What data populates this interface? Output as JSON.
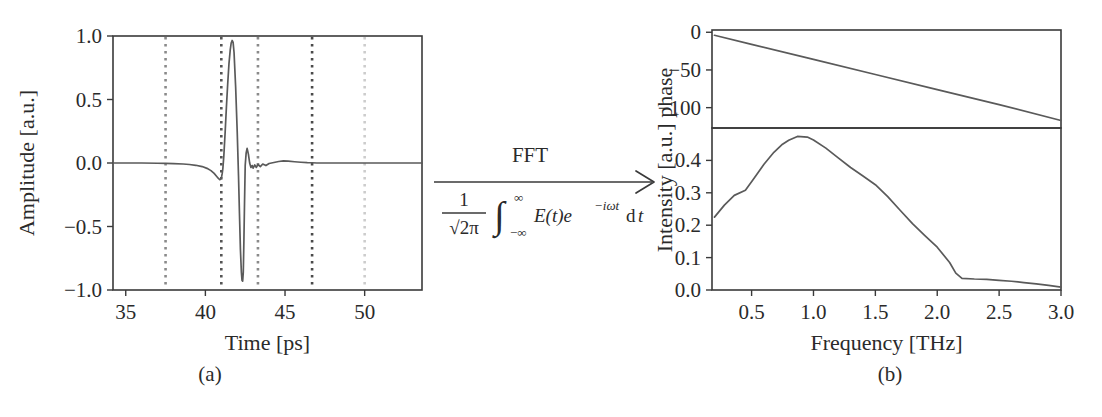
{
  "figure": {
    "sub_labels": {
      "a": "(a)",
      "b": "(b)"
    }
  },
  "transform": {
    "label": "FFT",
    "formula_prefix_num": "1",
    "formula_prefix_den": "√2π",
    "integral": "∫",
    "integral_upper": "∞",
    "integral_lower": "−∞",
    "integrand": "E(t)e",
    "integrand_exp": "−iωt",
    "differential_d": "d",
    "differential_t": "t",
    "arrow": "arrow-right"
  },
  "chart_data": [
    {
      "type": "line",
      "panel": "a",
      "title": "",
      "xlabel": "Time [ps]",
      "ylabel": "Amplitude [a.u.]",
      "xlim": [
        34.2,
        53.6
      ],
      "ylim": [
        -1.0,
        1.0
      ],
      "xticks": [
        35,
        40,
        45,
        50
      ],
      "xtick_labels": [
        "35",
        "40",
        "45",
        "50"
      ],
      "yticks": [
        -1.0,
        -0.5,
        0.0,
        0.5,
        1.0
      ],
      "ytick_labels": [
        "−1.0",
        "−0.5",
        "0.0",
        "0.5",
        "1.0"
      ],
      "grid": false,
      "legend": "none",
      "line_color": "#5a5a5a",
      "markers": [
        {
          "x": 37.5,
          "color": "#8a8a8a",
          "label": "marker-37.5ps"
        },
        {
          "x": 41.0,
          "color": "#555555",
          "label": "marker-41.0ps"
        },
        {
          "x": 43.3,
          "color": "#8a8a8a",
          "label": "marker-43.3ps"
        },
        {
          "x": 46.7,
          "color": "#4a4a4a",
          "label": "marker-46.7ps"
        },
        {
          "x": 50.0,
          "color": "#cccccc",
          "label": "marker-50.0ps"
        }
      ],
      "x": [
        34.2,
        35.0,
        36.0,
        37.0,
        37.5,
        38.0,
        38.6,
        39.0,
        39.4,
        39.8,
        40.1,
        40.35,
        40.55,
        40.7,
        40.82,
        40.9,
        40.96,
        41.02,
        41.06,
        41.1,
        41.16,
        41.24,
        41.32,
        41.4,
        41.48,
        41.56,
        41.62,
        41.68,
        41.74,
        41.8,
        41.9,
        42.0,
        42.08,
        42.14,
        42.2,
        42.26,
        42.3,
        42.34,
        42.38,
        42.42,
        42.46,
        42.5,
        42.56,
        42.62,
        42.7,
        42.78,
        42.86,
        42.94,
        43.0,
        43.1,
        43.2,
        43.3,
        43.45,
        43.6,
        43.8,
        44.0,
        44.3,
        44.6,
        44.9,
        45.2,
        45.6,
        46.0,
        46.4,
        46.7,
        47.0,
        47.5,
        48.0,
        49.0,
        50.0,
        51.0,
        52.0,
        53.0,
        53.6
      ],
      "y": [
        0.0,
        0.0,
        0.0,
        -0.002,
        -0.003,
        -0.005,
        -0.008,
        -0.012,
        -0.018,
        -0.028,
        -0.042,
        -0.06,
        -0.082,
        -0.104,
        -0.122,
        -0.131,
        -0.128,
        -0.108,
        -0.08,
        -0.04,
        0.06,
        0.24,
        0.44,
        0.62,
        0.78,
        0.89,
        0.945,
        0.965,
        0.95,
        0.87,
        0.6,
        0.24,
        -0.1,
        -0.4,
        -0.68,
        -0.86,
        -0.925,
        -0.93,
        -0.86,
        -0.6,
        -0.3,
        -0.02,
        0.08,
        0.115,
        0.07,
        0.0,
        -0.035,
        -0.02,
        -0.04,
        -0.015,
        -0.035,
        -0.012,
        -0.028,
        -0.008,
        -0.02,
        -0.004,
        0.004,
        0.012,
        0.016,
        0.014,
        0.01,
        0.006,
        0.003,
        0.002,
        0.0,
        0.0,
        0.0,
        0.0,
        0.0,
        0.0,
        0.0,
        0.0,
        0.0
      ]
    },
    {
      "type": "line",
      "panel": "b-top",
      "title": "",
      "xlabel": "Frequency [THz]",
      "ylabel": "phase",
      "xlim": [
        0.18,
        3.0
      ],
      "ylim": [
        -127,
        3
      ],
      "yticks": [
        0,
        -50,
        -100
      ],
      "ytick_labels": [
        "0",
        "−50",
        "−100"
      ],
      "grid": false,
      "legend": "none",
      "line_color": "#5a5a5a",
      "x": [
        0.2,
        0.5,
        1.0,
        1.5,
        2.0,
        2.5,
        3.0
      ],
      "y": [
        -4,
        -16,
        -36,
        -56,
        -76,
        -96,
        -117
      ]
    },
    {
      "type": "line",
      "panel": "b-bottom",
      "title": "",
      "xlabel": "Frequency [THz]",
      "ylabel": "Intensity [a.u.]",
      "xlim": [
        0.18,
        3.0
      ],
      "ylim": [
        0.0,
        0.5
      ],
      "xticks": [
        0.5,
        1.0,
        1.5,
        2.0,
        2.5,
        3.0
      ],
      "xtick_labels": [
        "0.5",
        "1.0",
        "1.5",
        "2.0",
        "2.5",
        "3.0"
      ],
      "yticks": [
        0.0,
        0.1,
        0.2,
        0.3,
        0.4
      ],
      "ytick_labels": [
        "0.0",
        "0.1",
        "0.2",
        "0.3",
        "0.4"
      ],
      "grid": false,
      "legend": "none",
      "line_color": "#5a5a5a",
      "x": [
        0.2,
        0.28,
        0.36,
        0.45,
        0.52,
        0.6,
        0.68,
        0.75,
        0.8,
        0.87,
        0.95,
        1.0,
        1.1,
        1.2,
        1.3,
        1.4,
        1.5,
        1.6,
        1.7,
        1.8,
        1.9,
        2.0,
        2.1,
        2.15,
        2.2,
        2.3,
        2.4,
        2.5,
        2.6,
        2.7,
        2.8,
        2.9,
        3.0
      ],
      "y": [
        0.225,
        0.262,
        0.292,
        0.308,
        0.345,
        0.388,
        0.425,
        0.45,
        0.462,
        0.474,
        0.472,
        0.463,
        0.438,
        0.408,
        0.378,
        0.352,
        0.325,
        0.288,
        0.246,
        0.205,
        0.168,
        0.132,
        0.085,
        0.052,
        0.036,
        0.034,
        0.033,
        0.03,
        0.027,
        0.023,
        0.019,
        0.014,
        0.009
      ]
    }
  ],
  "ylabel_b_full": "Intensity [a.u.] phase"
}
